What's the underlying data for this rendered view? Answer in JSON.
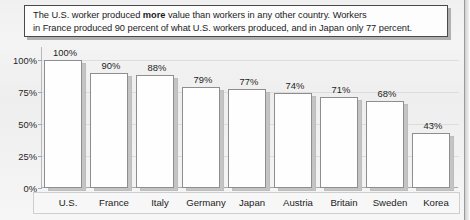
{
  "caption": {
    "line1_pre": "The U.S. worker produced ",
    "line1_bold": "more",
    "line1_post": " value than workers in any other country. Workers",
    "line2": "in France produced 90 percent of what U.S. workers produced, and in Japan only 77 percent."
  },
  "chart_data": {
    "type": "bar",
    "title": "",
    "xlabel": "",
    "ylabel": "",
    "categories": [
      "U.S.",
      "France",
      "Italy",
      "Germany",
      "Japan",
      "Austria",
      "Britain",
      "Sweden",
      "Korea"
    ],
    "values": [
      100,
      90,
      88,
      79,
      77,
      74,
      71,
      68,
      43
    ],
    "value_labels": [
      "100%",
      "90%",
      "88%",
      "79%",
      "77%",
      "74%",
      "71%",
      "68%",
      "43%"
    ],
    "ylim": [
      0,
      110
    ],
    "ytick_values": [
      0,
      25,
      50,
      75,
      100
    ],
    "ytick_labels": [
      "0%",
      "25%",
      "50%",
      "75%",
      "100%"
    ],
    "grid": true,
    "legend": "none",
    "bar_color": "#fefefe",
    "bar_edge_color": "#8e8e8e",
    "bar_shadow_color": "#c4c4c4",
    "background_color": "#f2f2f2",
    "text_color": "#1b1b1b"
  }
}
